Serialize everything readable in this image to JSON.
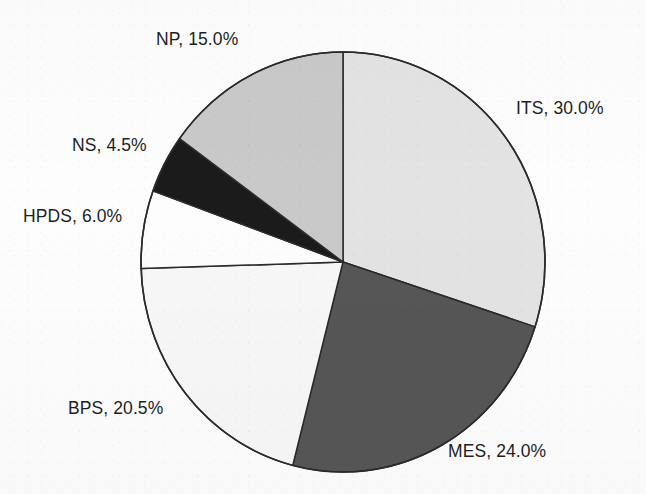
{
  "figure": {
    "kind": "pie-chart",
    "background_color": "#fdfdfd",
    "outline_color": "#2b2b2b",
    "label_color": "#1f1f1f"
  },
  "labels": {
    "its": "ITS, 30.0%",
    "mes": "MES, 24.0%",
    "bps": "BPS, 20.5%",
    "hpds": "HPDS, 6.0%",
    "ns": "NS, 4.5%",
    "np": "NP, 15.0%"
  },
  "chart_data": {
    "type": "pie",
    "title": "",
    "subtitle": "",
    "xlabel": "",
    "ylabel": "",
    "grid": false,
    "legend_position": "none",
    "label_format": "{name}, {value}%",
    "start_angle_deg": 90,
    "direction": "clockwise",
    "center_px": [
      343,
      262
    ],
    "radius_x_px": 202,
    "radius_y_px": 210,
    "total_percent": 100.0,
    "categories": [
      "ITS",
      "MES",
      "BPS",
      "HPDS",
      "NS",
      "NP"
    ],
    "values": [
      30.0,
      24.0,
      20.5,
      6.0,
      4.5,
      15.0
    ],
    "slice_colors": [
      "#e3e3e3",
      "#565656",
      "#f7f7f7",
      "#fdfdfd",
      "#1b1b1b",
      "#c9c9c9"
    ],
    "slices": [
      {
        "name": "ITS",
        "value": 30.0,
        "label": "ITS, 30.0%",
        "color": "#e3e3e3",
        "start_angle_deg": 0.0,
        "end_angle_deg": 108.0,
        "label_position": "right"
      },
      {
        "name": "MES",
        "value": 24.0,
        "label": "MES, 24.0%",
        "color": "#565656",
        "start_angle_deg": 108.0,
        "end_angle_deg": 194.4,
        "label_position": "bottom-right"
      },
      {
        "name": "BPS",
        "value": 20.5,
        "label": "BPS, 20.5%",
        "color": "#f7f7f7",
        "start_angle_deg": 194.4,
        "end_angle_deg": 268.2,
        "label_position": "bottom-left"
      },
      {
        "name": "HPDS",
        "value": 6.0,
        "label": "HPDS, 6.0%",
        "color": "#fdfdfd",
        "start_angle_deg": 268.2,
        "end_angle_deg": 289.8,
        "label_position": "left"
      },
      {
        "name": "NS",
        "value": 4.5,
        "label": "NS, 4.5%",
        "color": "#1b1b1b",
        "start_angle_deg": 289.8,
        "end_angle_deg": 306.0,
        "label_position": "upper-left"
      },
      {
        "name": "NP",
        "value": 15.0,
        "label": "NP, 15.0%",
        "color": "#c9c9c9",
        "start_angle_deg": 306.0,
        "end_angle_deg": 360.0,
        "label_position": "top"
      }
    ]
  }
}
